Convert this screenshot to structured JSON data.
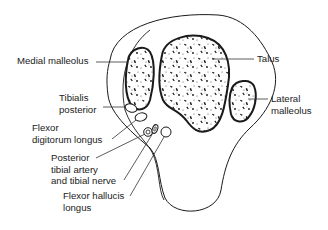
{
  "diagram": {
    "type": "anatomical cross-section",
    "colors": {
      "line": "#1a1a1a",
      "text": "#222222",
      "background": "#ffffff"
    },
    "labels": {
      "medial_malleolus": [
        "Medial malleolus"
      ],
      "talus": [
        "Talus"
      ],
      "tibialis_posterior": [
        "Tibialis",
        "posterior"
      ],
      "lateral_malleolus": [
        "Lateral",
        "malleolus"
      ],
      "flexor_digitorum_longus": [
        "Flexor",
        "digitorum longus"
      ],
      "posterior_tibial_artery_nerve": [
        "Posterior",
        "tibial artery",
        "and tibial nerve"
      ],
      "flexor_hallucis_longus": [
        "Flexor hallucis",
        "longus"
      ]
    }
  }
}
